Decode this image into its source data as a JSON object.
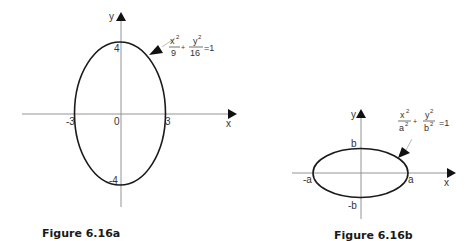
{
  "figures": [
    {
      "caption": "Figure 6.16a",
      "axis_x_label": "x",
      "axis_y_label": "y",
      "tick_left": "-3",
      "tick_origin": "0",
      "tick_right": "3",
      "tick_top": "4",
      "tick_bottom": "-4",
      "equation": {
        "term1_num": "x2",
        "term1_den": "9",
        "plus": "+",
        "term2_num": "y2",
        "term2_den": "16",
        "rhs": "=1",
        "x_sup": "2",
        "y_sup": "2"
      }
    },
    {
      "caption": "Figure 6.16b",
      "axis_x_label": "x",
      "axis_y_label": "y",
      "tick_left": "-a",
      "tick_right": "a",
      "tick_top": "b",
      "tick_bottom": "-b",
      "equation": {
        "plus": "+",
        "rhs": "=1",
        "x_sup": "2",
        "y_sup": "2",
        "a_den": "a",
        "b_den": "b",
        "a_sup": "2",
        "b_sup": "2"
      }
    }
  ],
  "colors": {
    "curve": "#1a1a1a",
    "axis": "#888888",
    "background": "#ffffff"
  }
}
